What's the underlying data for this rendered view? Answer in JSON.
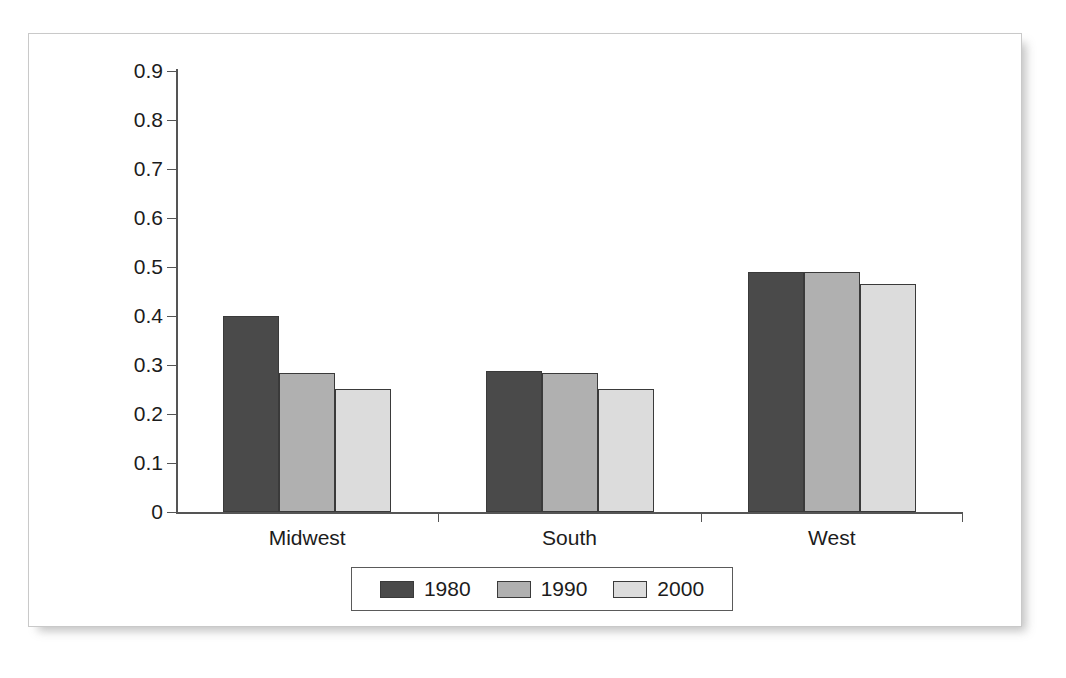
{
  "chart_data": {
    "type": "bar",
    "title": "",
    "subtitle": "",
    "xlabel": "",
    "ylabel": "",
    "categories": [
      "Midwest",
      "South",
      "West"
    ],
    "series": [
      {
        "name": "1980",
        "color": "#4a4a4a",
        "values": [
          0.4,
          0.288,
          0.49
        ]
      },
      {
        "name": "1990",
        "color": "#b0b0b0",
        "values": [
          0.283,
          0.284,
          0.49
        ]
      },
      {
        "name": "2000",
        "color": "#dcdcdc",
        "values": [
          0.252,
          0.252,
          0.466
        ]
      }
    ],
    "ylim": [
      0,
      0.9
    ],
    "ytick_step": 0.1,
    "ytick_labels": [
      "0.9",
      "0.8",
      "0.7",
      "0.6",
      "0.5",
      "0.4",
      "0.3",
      "0.2",
      "0.1",
      "0"
    ],
    "ytick_values": [
      0.9,
      0.8,
      0.7,
      0.6,
      0.5,
      0.4,
      0.3,
      0.2,
      0.1,
      0
    ],
    "grid": false,
    "legend_position": "bottom",
    "legend_entries": [
      "1980",
      "1990",
      "2000"
    ],
    "axis_color": "#555555",
    "bar_outline_color": "#3a3a3a",
    "plot_background": "#ffffff"
  },
  "figure": {
    "border_color": "#c9c9c9",
    "background": "#ffffff"
  }
}
